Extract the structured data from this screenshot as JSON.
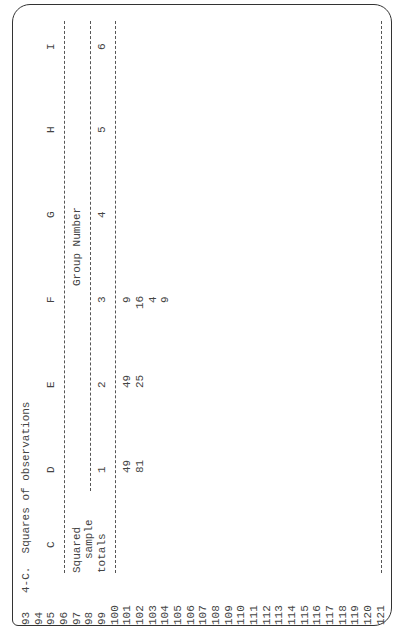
{
  "document": {
    "title": "4-C.  Squares of observations",
    "row_numbers": [
      "93",
      "94",
      "95",
      "96",
      "97",
      "98",
      "99",
      "100",
      "101",
      "102",
      "103",
      "104",
      "105",
      "106",
      "107",
      "108",
      "109",
      "110",
      "111",
      "112",
      "113",
      "114",
      "115",
      "116",
      "117",
      "118",
      "119",
      "120",
      "121"
    ],
    "column_letters": [
      "C",
      "D",
      "E",
      "F",
      "G",
      "H",
      "I"
    ],
    "row_label": [
      "Squared",
      "sample",
      "totals"
    ],
    "group_header": "Group Number",
    "group_numbers": [
      "1",
      "2",
      "3",
      "4",
      "5",
      "6"
    ],
    "columns": {
      "group2": [
        "49",
        "81"
      ],
      "group3": [
        "49",
        "25"
      ],
      "group4": [
        "9",
        "16",
        "4",
        "9"
      ]
    }
  }
}
